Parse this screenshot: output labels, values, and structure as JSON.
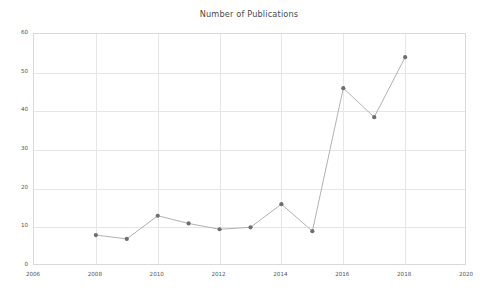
{
  "chart_data": {
    "type": "line",
    "title": "Number of Publications",
    "xlabel": "",
    "ylabel": "",
    "x": [
      2008,
      2009,
      2010,
      2011,
      2012,
      2013,
      2014,
      2015,
      2016,
      2017,
      2018
    ],
    "values": [
      8,
      7,
      13,
      11,
      9.5,
      10,
      16,
      9,
      46,
      38.5,
      54
    ],
    "series": [
      {
        "name": "Number of Publications",
        "x": [
          2008,
          2009,
          2010,
          2011,
          2012,
          2013,
          2014,
          2015,
          2016,
          2017,
          2018
        ],
        "values": [
          8,
          7,
          13,
          11,
          9.5,
          10,
          16,
          9,
          46,
          38.5,
          54
        ]
      }
    ],
    "xlim": [
      2006,
      2020
    ],
    "ylim": [
      0,
      60
    ],
    "xticks": [
      2006,
      2008,
      2010,
      2012,
      2014,
      2016,
      2018,
      2020
    ],
    "xtick_labels": [
      "2006",
      "2008",
      "2010",
      "2012",
      "2014",
      "2016",
      "2018",
      "2020"
    ],
    "yticks": [
      0,
      10,
      20,
      30,
      40,
      50,
      60
    ],
    "ytick_labels": [
      "0",
      "10",
      "20",
      "30",
      "40",
      "50",
      "60"
    ],
    "grid": true,
    "legend": false,
    "line_color": "#a8a8a8",
    "marker_color": "#6e6e6e",
    "grid_color": "#e6e6e6",
    "axis_color": "#d9d9d9",
    "background_color": "#ffffff",
    "marker": "circle"
  }
}
